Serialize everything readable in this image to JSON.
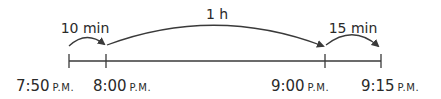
{
  "diagram": {
    "type": "elapsed-time number line",
    "colors": {
      "line": "#3a3a3a",
      "text": "#2a2a2a",
      "background": "#ffffff"
    },
    "ticks": [
      {
        "time": "7:50",
        "period": "P.M.",
        "x": 69
      },
      {
        "time": "8:00",
        "period": "P.M.",
        "x": 106
      },
      {
        "time": "9:00",
        "period": "P.M.",
        "x": 325
      },
      {
        "time": "9:15",
        "period": "P.M.",
        "x": 381
      }
    ],
    "jumps": [
      {
        "label": "10 min",
        "from": "7:50 P.M.",
        "to": "8:00 P.M."
      },
      {
        "label": "1 h",
        "from": "8:00 P.M.",
        "to": "9:00 P.M."
      },
      {
        "label": "15 min",
        "from": "9:00 P.M.",
        "to": "9:15 P.M."
      }
    ]
  }
}
